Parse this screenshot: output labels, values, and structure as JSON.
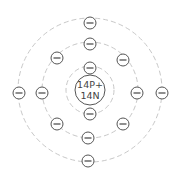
{
  "diagram": {
    "type": "bohr-atom-model",
    "nucleus": {
      "protons_label": "14P+",
      "neutrons_label": "14N"
    },
    "shells": [
      {
        "name": "shell-1",
        "electrons": 2
      },
      {
        "name": "shell-2",
        "electrons": 8
      },
      {
        "name": "shell-3",
        "electrons": 4
      }
    ],
    "electron_symbol": "−",
    "colors": {
      "orbit": "#c8c8c8",
      "outline": "#555555",
      "background": "#ffffff"
    }
  }
}
